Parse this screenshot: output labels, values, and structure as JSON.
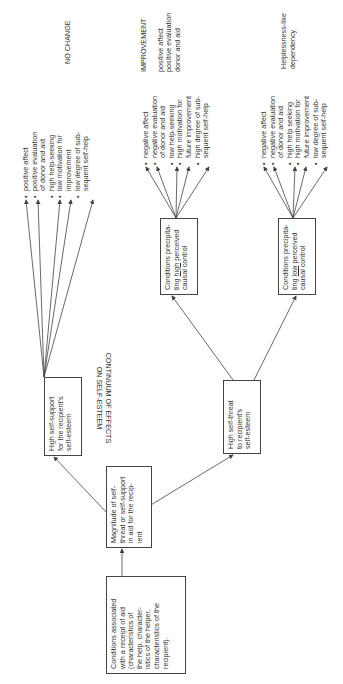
{
  "diagram": {
    "orientation": "rotated 90deg counter-clockwise",
    "continuum_label": {
      "line1": "CONTINUUM OF EFFECTS",
      "line2": "ON SELF-ESTEEM"
    },
    "nodes": {
      "conditions": {
        "lines": [
          "Conditions associated",
          "with a receipt of aid",
          "(characteristics of",
          "the help, character-",
          "istics of the helper,",
          "characteristics of the",
          "recipient)."
        ]
      },
      "magnitude": {
        "lines": [
          "Magnitude of self-",
          "threat or self-support",
          "in aid for the recip-",
          "ient"
        ]
      },
      "high_support": {
        "lines": [
          "High self-support",
          "for the recipient's",
          "self-esteem"
        ]
      },
      "high_threat": {
        "lines": [
          "High self-threat",
          "to recipient's",
          "self-esteem"
        ]
      },
      "high_control": {
        "line1": "Conditions precipita-",
        "line2_pre": "ting ",
        "line2_u": "high",
        "line2_post": " perceived",
        "line3": "causal control"
      },
      "low_control": {
        "line1": "Conditions precipita-",
        "line2_pre": "ting ",
        "line2_u": "low",
        "line2_post": " perceived",
        "line3": "causal control"
      }
    },
    "outcomes": {
      "no_change": {
        "label": "NO CHANGE",
        "items": [
          [
            "positive affect"
          ],
          [
            "positive evaluation",
            "of donor and aid"
          ],
          [
            "high help-seeking"
          ],
          [
            "low motivation for",
            "improvement"
          ],
          [
            "low degree of sub-",
            "sequent self-help"
          ]
        ]
      },
      "improvement": {
        "label": "IMPROVEMENT",
        "extra_lines": [
          "positive affect",
          "positive evaluation",
          "donor and aid"
        ],
        "items": [
          [
            "negative affect"
          ],
          [
            "negative evaluation",
            "of donor and aid"
          ],
          [
            "low help-seeking"
          ],
          [
            "high motivation for",
            "future improvement"
          ],
          [
            "high degree of sub-",
            "sequent self-help"
          ]
        ]
      },
      "helplessness": {
        "label_lines": [
          "Helplessness-like",
          "dependency"
        ],
        "items": [
          [
            "negative affect"
          ],
          [
            "negative evaluation",
            "of donor and aid"
          ],
          [
            "high help seeking"
          ],
          [
            "high motivation for",
            "future improvement"
          ],
          [
            "low degree of sub-",
            "sequent self-help"
          ]
        ]
      }
    },
    "colors": {
      "line": "#444444",
      "text": "#333333",
      "background": "#ffffff"
    }
  }
}
